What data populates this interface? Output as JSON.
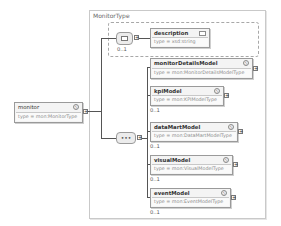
{
  "diagram": {
    "complex_type": "MonitorType",
    "root": {
      "name": "monitor",
      "type": "type = mon:MonitorType",
      "badge": "Ⓢ"
    },
    "optional_group": {
      "compositor": "choice",
      "cardinality": "0..1",
      "element": {
        "name": "description",
        "type": "type = xsd:string"
      }
    },
    "sequence": {
      "compositor_label": "•••",
      "elements": [
        {
          "name": "monitorDetailsModel",
          "type": "type = mon:MonitorDetailsModelType",
          "badge": "Ⓢ",
          "cardinality": ""
        },
        {
          "name": "kpiModel",
          "type": "type = mon:KPIModelType",
          "badge": "Ⓢ",
          "cardinality": "0..1"
        },
        {
          "name": "dataMartModel",
          "type": "type = mon:DataMartModelType",
          "badge": "Ⓢ",
          "cardinality": "0..1"
        },
        {
          "name": "visualModel",
          "type": "type = mon:VisualModelType",
          "badge": "Ⓢ",
          "cardinality": "0..1"
        },
        {
          "name": "eventModel",
          "type": "type = mon:EventModelType",
          "badge": "Ⓢ",
          "cardinality": "0..1"
        }
      ]
    },
    "expand_symbol": "+"
  }
}
